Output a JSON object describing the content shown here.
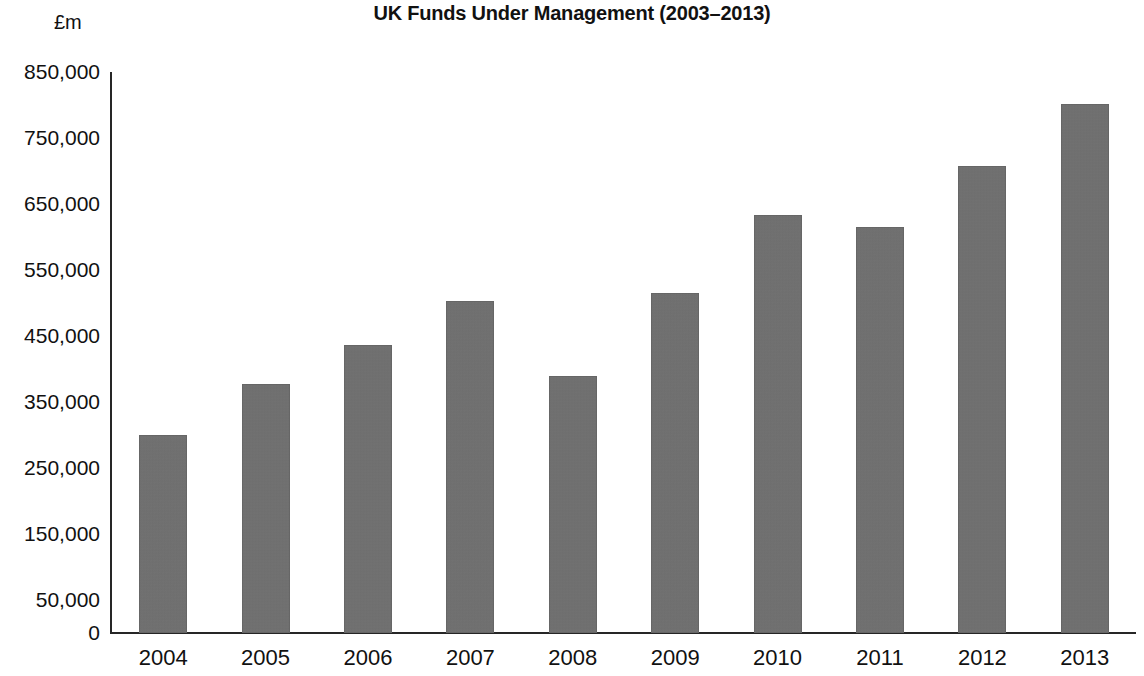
{
  "chart_data": {
    "type": "bar",
    "title": "UK Funds Under Management (2003–2013)",
    "xlabel": "",
    "ylabel": "£m",
    "categories": [
      "2004",
      "2005",
      "2006",
      "2007",
      "2008",
      "2009",
      "2010",
      "2011",
      "2012",
      "2013"
    ],
    "values": [
      300000,
      378000,
      437000,
      503000,
      390000,
      515000,
      633000,
      615000,
      708000,
      802000
    ],
    "ylim": [
      0,
      850000
    ],
    "ytick_values": [
      0,
      50000,
      150000,
      250000,
      350000,
      450000,
      550000,
      650000,
      750000,
      850000
    ],
    "ytick_labels": [
      "0",
      "50,000",
      "150,000",
      "250,000",
      "350,000",
      "450,000",
      "550,000",
      "650,000",
      "750,000",
      "850,000"
    ],
    "grid": false,
    "legend": null,
    "series": [
      {
        "name": "UK Funds Under Management",
        "values": [
          300000,
          378000,
          437000,
          503000,
          390000,
          515000,
          633000,
          615000,
          708000,
          802000
        ]
      }
    ],
    "bar_color": "#6f6f6f",
    "axis_color": "#262626",
    "background_color": "#ffffff",
    "text_color": "#111111"
  }
}
